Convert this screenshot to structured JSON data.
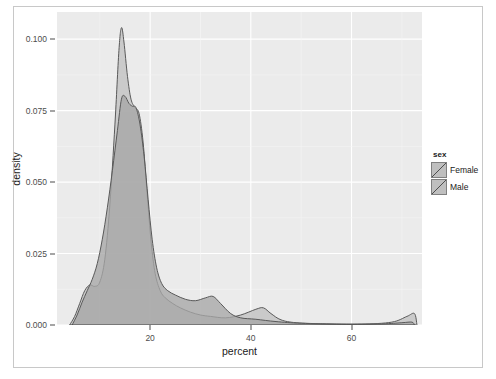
{
  "chart_data": {
    "type": "area",
    "title": "",
    "subtitle": "",
    "xlabel": "percent",
    "ylabel": "density",
    "xlim": [
      1.5,
      74
    ],
    "ylim": [
      0,
      0.1095
    ],
    "xticks": [
      20,
      40,
      60
    ],
    "yticks": [
      0.0,
      0.025,
      0.05,
      0.075,
      0.1
    ],
    "ytick_labels": [
      "0.000",
      "0.025",
      "0.050",
      "0.075",
      "0.100"
    ],
    "xtick_labels": [
      "20",
      "40",
      "60"
    ],
    "grid": true,
    "grid_major_color": "#ffffff",
    "panel_background": "#ebebeb",
    "legend": {
      "title": "sex",
      "position": "right",
      "entries": [
        {
          "label": "Female",
          "fill": "#bfbfbf",
          "line": "#4d4d4d"
        },
        {
          "label": "Male",
          "fill": "#bfbfbf",
          "line": "#4d4d4d"
        }
      ]
    },
    "series": [
      {
        "name": "Female",
        "fill": "#c4c4c4",
        "line": "#595959",
        "points": [
          {
            "x": 4.0,
            "y": 0.0
          },
          {
            "x": 5.0,
            "y": 0.003
          },
          {
            "x": 6.0,
            "y": 0.0075
          },
          {
            "x": 7.0,
            "y": 0.012
          },
          {
            "x": 8.0,
            "y": 0.014
          },
          {
            "x": 9.0,
            "y": 0.0135
          },
          {
            "x": 10.0,
            "y": 0.015
          },
          {
            "x": 11.0,
            "y": 0.023
          },
          {
            "x": 12.0,
            "y": 0.042
          },
          {
            "x": 13.0,
            "y": 0.07
          },
          {
            "x": 13.8,
            "y": 0.096
          },
          {
            "x": 14.3,
            "y": 0.104
          },
          {
            "x": 14.8,
            "y": 0.099
          },
          {
            "x": 15.5,
            "y": 0.087
          },
          {
            "x": 16.2,
            "y": 0.079
          },
          {
            "x": 17.0,
            "y": 0.076
          },
          {
            "x": 17.8,
            "y": 0.074
          },
          {
            "x": 18.6,
            "y": 0.064
          },
          {
            "x": 19.4,
            "y": 0.046
          },
          {
            "x": 20.2,
            "y": 0.029
          },
          {
            "x": 21.0,
            "y": 0.018
          },
          {
            "x": 22.0,
            "y": 0.012
          },
          {
            "x": 23.0,
            "y": 0.0095
          },
          {
            "x": 24.5,
            "y": 0.0075
          },
          {
            "x": 26.0,
            "y": 0.006
          },
          {
            "x": 28.0,
            "y": 0.0045
          },
          {
            "x": 30.0,
            "y": 0.0035
          },
          {
            "x": 32.0,
            "y": 0.003
          },
          {
            "x": 35.0,
            "y": 0.0025
          },
          {
            "x": 38.0,
            "y": 0.0035
          },
          {
            "x": 41.0,
            "y": 0.0055
          },
          {
            "x": 42.5,
            "y": 0.006
          },
          {
            "x": 44.0,
            "y": 0.004
          },
          {
            "x": 46.0,
            "y": 0.0018
          },
          {
            "x": 49.0,
            "y": 0.0008
          },
          {
            "x": 55.0,
            "y": 0.0004
          },
          {
            "x": 62.0,
            "y": 0.0003
          },
          {
            "x": 68.0,
            "y": 0.001
          },
          {
            "x": 71.0,
            "y": 0.003
          },
          {
            "x": 72.5,
            "y": 0.004
          },
          {
            "x": 73.0,
            "y": 0.0
          }
        ]
      },
      {
        "name": "Male",
        "fill": "#a6a6a6",
        "line": "#595959",
        "points": [
          {
            "x": 4.5,
            "y": 0.0
          },
          {
            "x": 5.5,
            "y": 0.0035
          },
          {
            "x": 6.5,
            "y": 0.008
          },
          {
            "x": 7.5,
            "y": 0.012
          },
          {
            "x": 8.5,
            "y": 0.016
          },
          {
            "x": 9.5,
            "y": 0.0215
          },
          {
            "x": 10.5,
            "y": 0.03
          },
          {
            "x": 11.5,
            "y": 0.041
          },
          {
            "x": 12.5,
            "y": 0.054
          },
          {
            "x": 13.5,
            "y": 0.068
          },
          {
            "x": 14.3,
            "y": 0.079
          },
          {
            "x": 15.0,
            "y": 0.08
          },
          {
            "x": 15.8,
            "y": 0.0775
          },
          {
            "x": 16.5,
            "y": 0.0765
          },
          {
            "x": 17.2,
            "y": 0.076
          },
          {
            "x": 18.0,
            "y": 0.07
          },
          {
            "x": 18.8,
            "y": 0.059
          },
          {
            "x": 19.6,
            "y": 0.044
          },
          {
            "x": 20.4,
            "y": 0.03
          },
          {
            "x": 21.3,
            "y": 0.02
          },
          {
            "x": 22.3,
            "y": 0.0145
          },
          {
            "x": 23.5,
            "y": 0.012
          },
          {
            "x": 25.0,
            "y": 0.0105
          },
          {
            "x": 27.0,
            "y": 0.009
          },
          {
            "x": 29.0,
            "y": 0.0085
          },
          {
            "x": 31.0,
            "y": 0.0095
          },
          {
            "x": 32.5,
            "y": 0.01
          },
          {
            "x": 34.0,
            "y": 0.0075
          },
          {
            "x": 36.0,
            "y": 0.004
          },
          {
            "x": 38.0,
            "y": 0.0025
          },
          {
            "x": 41.0,
            "y": 0.002
          },
          {
            "x": 45.0,
            "y": 0.0012
          },
          {
            "x": 50.0,
            "y": 0.0006
          },
          {
            "x": 58.0,
            "y": 0.0003
          },
          {
            "x": 66.0,
            "y": 0.0004
          },
          {
            "x": 70.0,
            "y": 0.0008
          },
          {
            "x": 72.0,
            "y": 0.001
          },
          {
            "x": 72.5,
            "y": 0.0
          }
        ]
      }
    ]
  }
}
